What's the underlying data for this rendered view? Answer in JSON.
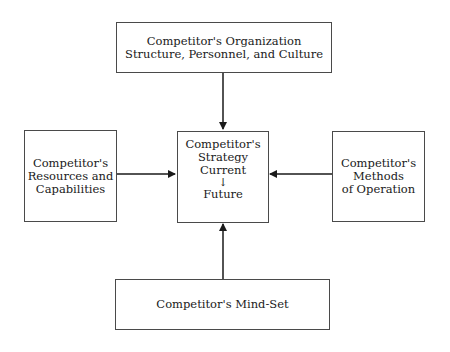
{
  "diagram": {
    "top_box": {
      "lines": [
        "Competitor's Organization",
        "Structure, Personnel, and Culture"
      ]
    },
    "left_box": {
      "lines": [
        "Competitor's",
        "Resources and",
        "Capabilities"
      ]
    },
    "center_box": {
      "lines": [
        "Competitor's",
        "Strategy",
        "Current"
      ],
      "inner_arrow": "↓",
      "future": "Future"
    },
    "right_box": {
      "lines": [
        "Competitor's",
        "Methods",
        "of Operation"
      ]
    },
    "bottom_box": {
      "lines": [
        "Competitor's Mind-Set"
      ]
    },
    "edges": [
      {
        "from": "top_box",
        "to": "center_box"
      },
      {
        "from": "left_box",
        "to": "center_box"
      },
      {
        "from": "right_box",
        "to": "center_box"
      },
      {
        "from": "bottom_box",
        "to": "center_box"
      }
    ],
    "colors": {
      "border": "#4a4a4a",
      "text": "#1a1a1a",
      "arrow": "#1a1a1a"
    }
  }
}
